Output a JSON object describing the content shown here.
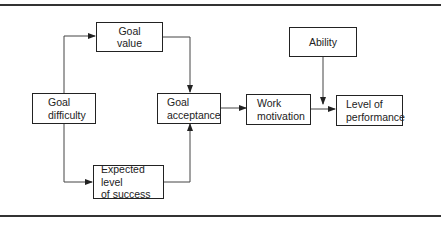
{
  "diagram": {
    "nodes": {
      "goal_value": {
        "line1": "Goal",
        "line2": "value"
      },
      "goal_difficulty": {
        "line1": "Goal",
        "line2": "difficulty"
      },
      "goal_acceptance": {
        "line1": "Goal",
        "line2": "acceptance"
      },
      "work_motivation": {
        "line1": "Work",
        "line2": "motivation"
      },
      "level_of_performance": {
        "line1": "Level of",
        "line2": "performance"
      },
      "ability": {
        "line1": "Ability"
      },
      "expected_level_of_success": {
        "line1": "Expected level",
        "line2": "of success"
      }
    },
    "edges": [
      {
        "from": "Goal difficulty",
        "to": "Goal value"
      },
      {
        "from": "Goal difficulty",
        "to": "Expected level of success"
      },
      {
        "from": "Goal value",
        "to": "Goal acceptance"
      },
      {
        "from": "Expected level of success",
        "to": "Goal acceptance"
      },
      {
        "from": "Goal acceptance",
        "to": "Work motivation"
      },
      {
        "from": "Work motivation",
        "to": "Level of performance"
      },
      {
        "from": "Ability",
        "to": "Level of performance"
      }
    ],
    "colors": {
      "line": "#222222",
      "background": "#ffffff"
    }
  }
}
